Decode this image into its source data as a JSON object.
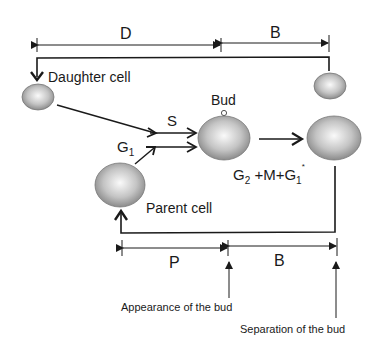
{
  "diagram": {
    "labels": {
      "D": "D",
      "B_top": "B",
      "daughter_cell": "Daughter cell",
      "bud": "Bud",
      "S": "S",
      "G1": "G",
      "G1_sub": "1",
      "G2": "G",
      "G2_sub": "2",
      "G2_rest": " +M+G",
      "G2_rest_sub": "1",
      "G2_star": "*",
      "parent_cell": "Parent cell",
      "P": "P",
      "B_bottom": "B",
      "appearance": "Appearance of the bud",
      "separation": "Separation of the bud"
    },
    "colors": {
      "line": "#1a1a1a",
      "cell_light": "#f4f4f4",
      "cell_dark": "#8a8a8a"
    }
  }
}
